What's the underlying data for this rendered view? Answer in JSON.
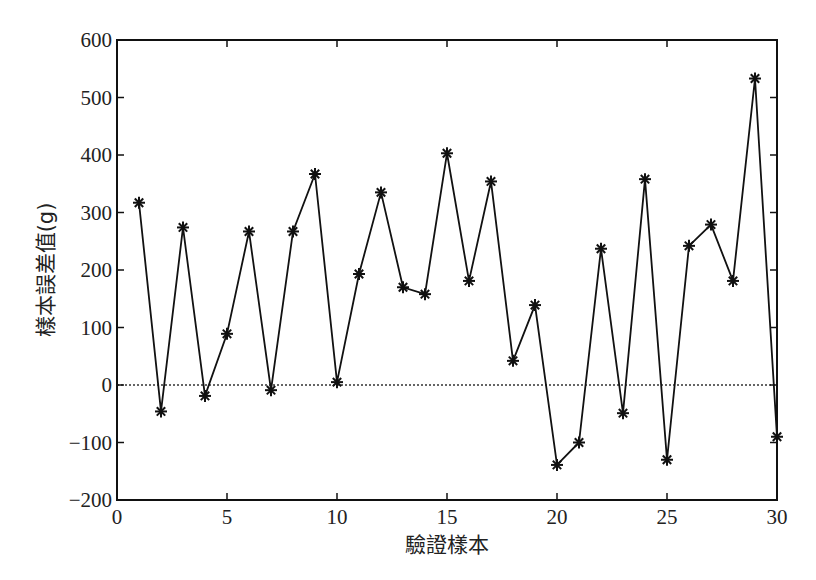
{
  "chart_data": {
    "type": "line",
    "title": "",
    "xlabel": "驗證樣本",
    "ylabel": "樣本誤差值(g)",
    "xlim": [
      0,
      30
    ],
    "ylim": [
      -200,
      600
    ],
    "xticks": [
      0,
      5,
      10,
      15,
      20,
      25,
      30
    ],
    "yticks": [
      -200,
      -100,
      0,
      100,
      200,
      300,
      400,
      500,
      600
    ],
    "ytick_labels": [
      "−200",
      "−100",
      "0",
      "100",
      "200",
      "300",
      "400",
      "500",
      "600"
    ],
    "grid": false,
    "legend": null,
    "marker": "*",
    "reference_line": {
      "y": 0,
      "style": "dotted"
    },
    "x": [
      1,
      2,
      3,
      4,
      5,
      6,
      7,
      8,
      9,
      10,
      11,
      12,
      13,
      14,
      15,
      16,
      17,
      18,
      19,
      20,
      21,
      22,
      23,
      24,
      25,
      26,
      27,
      28,
      29,
      30
    ],
    "series": [
      {
        "name": "樣本誤差值",
        "values": [
          317,
          -46,
          274,
          -19,
          89,
          267,
          -9,
          267,
          367,
          5,
          193,
          335,
          170,
          158,
          403,
          181,
          354,
          42,
          139,
          -139,
          -100,
          237,
          -49,
          358,
          -130,
          242,
          279,
          181,
          533,
          -90
        ]
      }
    ]
  },
  "colors": {
    "line": "#111111",
    "axis": "#111111",
    "background": "#ffffff"
  }
}
